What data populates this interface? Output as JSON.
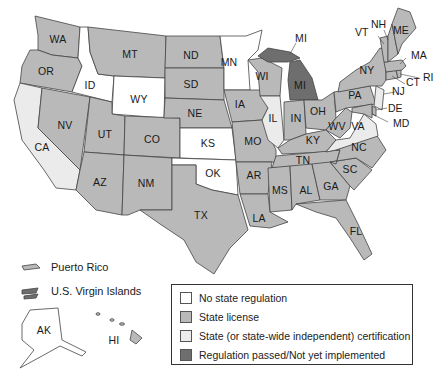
{
  "colors": {
    "no_regulation": "#ffffff",
    "state_license": "#b9b9b9",
    "state_certification": "#ebebeb",
    "regulation_passed": "#6e6e6e",
    "border": "#444444"
  },
  "legend": {
    "items": [
      {
        "label": "No state regulation",
        "category": "no_regulation"
      },
      {
        "label": "State license",
        "category": "state_license"
      },
      {
        "label": "State (or state-wide independent) certification",
        "category": "state_certification"
      },
      {
        "label": "Regulation passed/Not yet implemented",
        "category": "regulation_passed"
      }
    ]
  },
  "territories": {
    "puerto_rico": "Puerto Rico",
    "virgin_islands": "U.S. Virgin Islands"
  },
  "states": {
    "WA": {
      "label": "WA",
      "category": "state_license"
    },
    "OR": {
      "label": "OR",
      "category": "state_license"
    },
    "CA": {
      "label": "CA",
      "category": "state_certification"
    },
    "ID": {
      "label": "ID",
      "category": "no_regulation"
    },
    "NV": {
      "label": "NV",
      "category": "state_license"
    },
    "MT": {
      "label": "MT",
      "category": "state_license"
    },
    "WY": {
      "label": "WY",
      "category": "no_regulation"
    },
    "UT": {
      "label": "UT",
      "category": "state_license"
    },
    "AZ": {
      "label": "AZ",
      "category": "state_license"
    },
    "CO": {
      "label": "CO",
      "category": "state_license"
    },
    "NM": {
      "label": "NM",
      "category": "state_license"
    },
    "ND": {
      "label": "ND",
      "category": "state_license"
    },
    "SD": {
      "label": "SD",
      "category": "state_license"
    },
    "NE": {
      "label": "NE",
      "category": "state_license"
    },
    "KS": {
      "label": "KS",
      "category": "no_regulation"
    },
    "OK": {
      "label": "OK",
      "category": "no_regulation"
    },
    "TX": {
      "label": "TX",
      "category": "state_license"
    },
    "MN": {
      "label": "MN",
      "category": "no_regulation"
    },
    "IA": {
      "label": "IA",
      "category": "state_license"
    },
    "MO": {
      "label": "MO",
      "category": "state_license"
    },
    "AR": {
      "label": "AR",
      "category": "state_license"
    },
    "LA": {
      "label": "LA",
      "category": "state_license"
    },
    "WI": {
      "label": "WI",
      "category": "state_license"
    },
    "IL": {
      "label": "IL",
      "category": "state_certification"
    },
    "MI": {
      "label": "MI",
      "category": "regulation_passed"
    },
    "IN": {
      "label": "IN",
      "category": "state_license"
    },
    "OH": {
      "label": "OH",
      "category": "state_license"
    },
    "KY": {
      "label": "KY",
      "category": "state_license"
    },
    "TN": {
      "label": "TN",
      "category": "state_license"
    },
    "MS": {
      "label": "MS",
      "category": "state_license"
    },
    "AL": {
      "label": "AL",
      "category": "state_license"
    },
    "GA": {
      "label": "GA",
      "category": "state_license"
    },
    "FL": {
      "label": "FL",
      "category": "state_license"
    },
    "SC": {
      "label": "SC",
      "category": "state_license"
    },
    "NC": {
      "label": "NC",
      "category": "state_license"
    },
    "VA": {
      "label": "VA",
      "category": "state_certification"
    },
    "WV": {
      "label": "WV",
      "category": "state_license"
    },
    "PA": {
      "label": "PA",
      "category": "state_license"
    },
    "NY": {
      "label": "NY",
      "category": "state_license"
    },
    "NJ": {
      "label": "NJ",
      "category": "state_certification"
    },
    "DE": {
      "label": "DE",
      "category": "state_license"
    },
    "MD": {
      "label": "MD",
      "category": "state_license"
    },
    "CT": {
      "label": "CT",
      "category": "state_license"
    },
    "RI": {
      "label": "RI",
      "category": "state_license"
    },
    "MA": {
      "label": "MA",
      "category": "state_license"
    },
    "VT": {
      "label": "VT",
      "category": "state_license"
    },
    "NH": {
      "label": "NH",
      "category": "state_license"
    },
    "ME": {
      "label": "ME",
      "category": "state_license"
    },
    "AK": {
      "label": "AK",
      "category": "no_regulation"
    },
    "HI": {
      "label": "HI",
      "category": "state_license"
    }
  },
  "extra_labels": {
    "MI_upper": "MI"
  }
}
